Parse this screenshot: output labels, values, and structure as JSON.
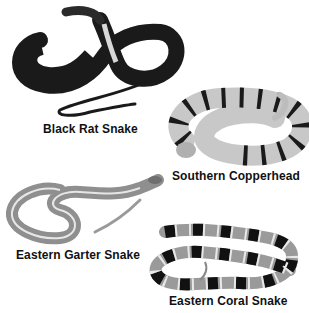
{
  "figure": {
    "snakes": [
      {
        "name": "Black Rat Snake",
        "tone": "#1a1a1a"
      },
      {
        "name": "Southern Copperhead",
        "tone": "#cfcfcf"
      },
      {
        "name": "Eastern Garter Snake",
        "tone": "#9a9a9a"
      },
      {
        "name": "Eastern Coral Snake",
        "tone": "#8c8c8c"
      }
    ]
  }
}
